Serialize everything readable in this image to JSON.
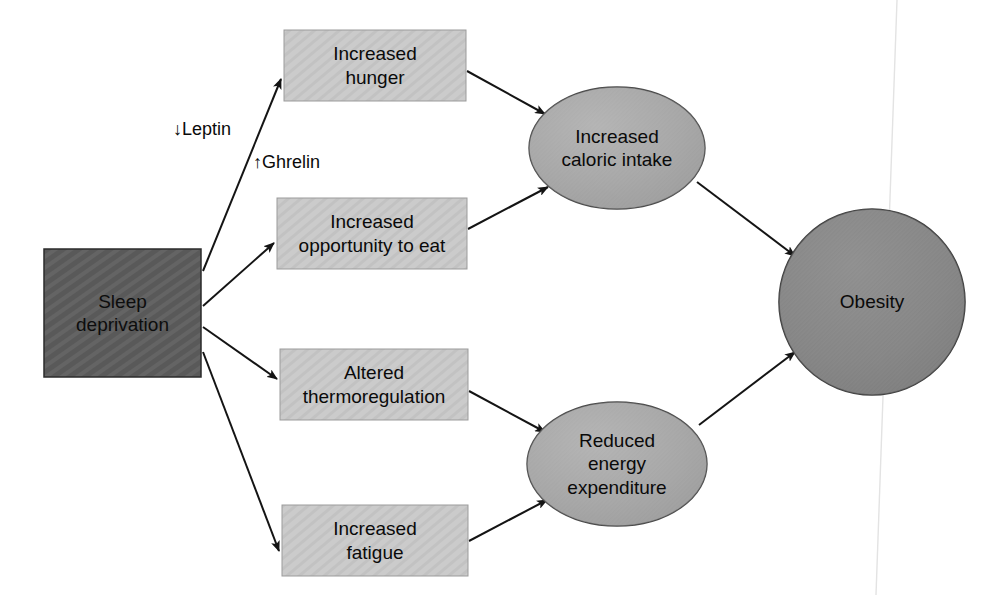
{
  "diagram": {
    "canvas": {
      "width": 1000,
      "height": 595,
      "background": "#ffffff"
    },
    "colors": {
      "source_box_fill": "#595959",
      "mediator_box_fill": "#c9c9c9",
      "ellipse_fill": "#a8a8a8",
      "outcome_fill": "#878787",
      "stroke": "#1a1a1a",
      "text": "#0a0a0a"
    },
    "nodes": [
      {
        "id": "sleep-deprivation",
        "label": "Sleep\ndeprivation",
        "shape": "rect",
        "fill": "#595959",
        "x": 44,
        "y": 249,
        "w": 157,
        "h": 128
      },
      {
        "id": "increased-hunger",
        "label": "Increased\nhunger",
        "shape": "rect",
        "fill": "#c9c9c9",
        "x": 284,
        "y": 30,
        "w": 182,
        "h": 71
      },
      {
        "id": "increased-opportunity-to-eat",
        "label": "Increased\nopportunity to eat",
        "shape": "rect",
        "fill": "#c9c9c9",
        "x": 277,
        "y": 198,
        "w": 190,
        "h": 71
      },
      {
        "id": "altered-thermoregulation",
        "label": "Altered\nthermoregulation",
        "shape": "rect",
        "fill": "#c9c9c9",
        "x": 280,
        "y": 349,
        "w": 188,
        "h": 71
      },
      {
        "id": "increased-fatigue",
        "label": "Increased\nfatigue",
        "shape": "rect",
        "fill": "#c9c9c9",
        "x": 282,
        "y": 505,
        "w": 186,
        "h": 71
      },
      {
        "id": "increased-caloric-intake",
        "label": "Increased\ncaloric intake",
        "shape": "ellipse",
        "fill": "#a8a8a8",
        "cx": 617,
        "cy": 148,
        "rx": 88,
        "ry": 61
      },
      {
        "id": "reduced-energy-expenditure",
        "label": "Reduced\nenergy\nexpenditure",
        "shape": "ellipse",
        "fill": "#a8a8a8",
        "cx": 617,
        "cy": 464,
        "rx": 90,
        "ry": 62
      },
      {
        "id": "obesity",
        "label": "Obesity",
        "shape": "circle",
        "fill": "#878787",
        "cx": 872,
        "cy": 302,
        "r": 93
      }
    ],
    "edge_labels": [
      {
        "id": "leptin",
        "text": "↓Leptin",
        "x": 173,
        "y": 119
      },
      {
        "id": "ghrelin",
        "text": "↑Ghrelin",
        "x": 253,
        "y": 152
      }
    ],
    "edges": [
      {
        "id": "sleep-to-hunger",
        "from": "sleep-deprivation",
        "to": "increased-hunger"
      },
      {
        "id": "sleep-to-opportunity",
        "from": "sleep-deprivation",
        "to": "increased-opportunity-to-eat"
      },
      {
        "id": "sleep-to-thermoregulation",
        "from": "sleep-deprivation",
        "to": "altered-thermoregulation"
      },
      {
        "id": "sleep-to-fatigue",
        "from": "sleep-deprivation",
        "to": "increased-fatigue"
      },
      {
        "id": "hunger-to-caloric-intake",
        "from": "increased-hunger",
        "to": "increased-caloric-intake"
      },
      {
        "id": "opportunity-to-caloric-intake",
        "from": "increased-opportunity-to-eat",
        "to": "increased-caloric-intake"
      },
      {
        "id": "thermoregulation-to-energy-expenditure",
        "from": "altered-thermoregulation",
        "to": "reduced-energy-expenditure"
      },
      {
        "id": "fatigue-to-energy-expenditure",
        "from": "increased-fatigue",
        "to": "reduced-energy-expenditure"
      },
      {
        "id": "caloric-intake-to-obesity",
        "from": "increased-caloric-intake",
        "to": "obesity"
      },
      {
        "id": "energy-expenditure-to-obesity",
        "from": "reduced-energy-expenditure",
        "to": "obesity"
      }
    ]
  }
}
